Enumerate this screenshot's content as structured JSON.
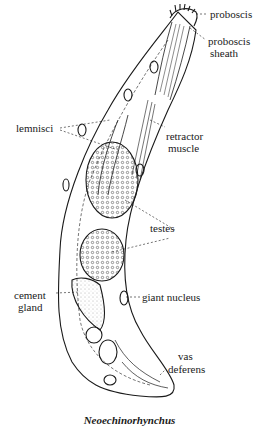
{
  "figure": {
    "caption": "Neoechinorhynchus",
    "labels": {
      "proboscis": "proboscis",
      "proboscis_sheath_1": "proboscis",
      "proboscis_sheath_2": "sheath",
      "retractor_1": "retractor",
      "retractor_2": "muscle",
      "lemnisci": "lemnisci",
      "testes": "testes",
      "cement_1": "cement",
      "cement_2": "gland",
      "giant_nucleus": "giant nucleus",
      "vas_1": "vas",
      "vas_2": "deferens"
    },
    "colors": {
      "ink": "#1a1a1a",
      "background": "#ffffff"
    }
  }
}
